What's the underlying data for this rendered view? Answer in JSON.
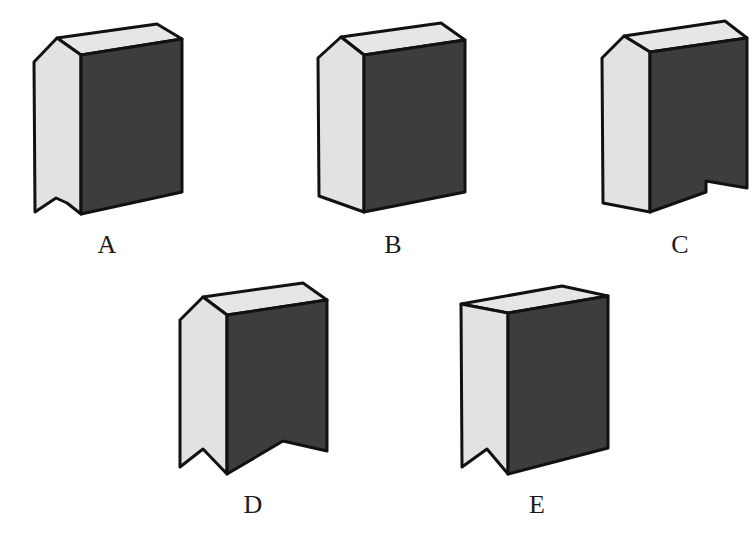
{
  "colors": {
    "light_face": "#e2e2e2",
    "dark_face": "#3d3d3d",
    "top_face": "#e6e6e6",
    "stroke": "#111111"
  },
  "options": [
    {
      "label": "A",
      "description": "prism with notch cut in bottom of light (left) face",
      "label_pos": [
        107,
        250
      ]
    },
    {
      "label": "B",
      "description": "plain pentagonal prism, no notches",
      "label_pos": [
        393,
        250
      ]
    },
    {
      "label": "C",
      "description": "prism with notch cut in bottom of dark (right) face",
      "label_pos": [
        680,
        250
      ]
    },
    {
      "label": "D",
      "description": "prism with notches cut in bottom of both faces",
      "label_pos": [
        253,
        510
      ]
    },
    {
      "label": "E",
      "description": "box with flat top edge, notch in bottom of light face",
      "label_pos": [
        537,
        510
      ]
    }
  ]
}
